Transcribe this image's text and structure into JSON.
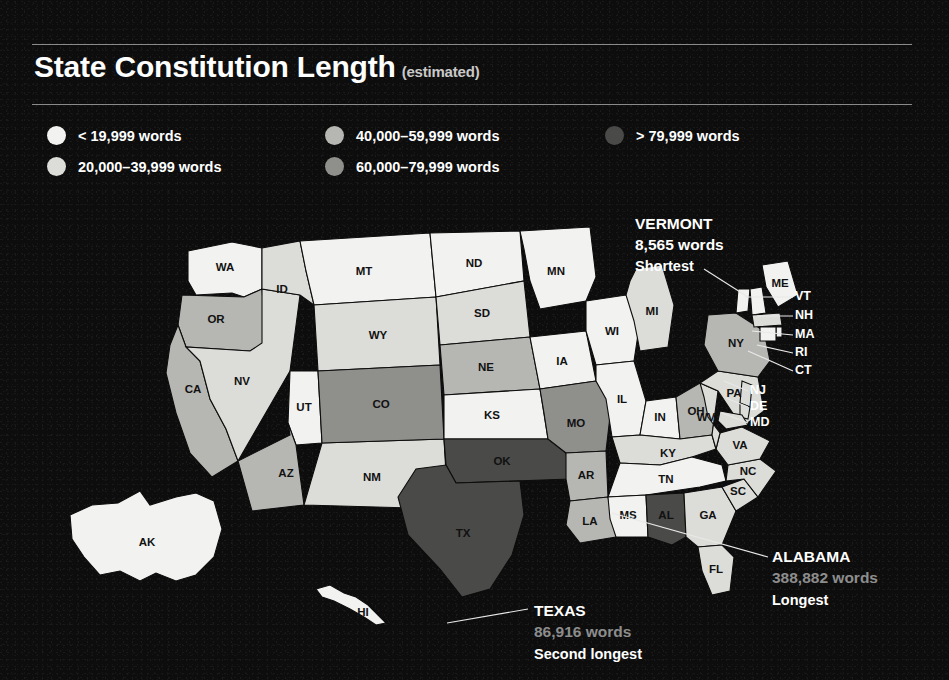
{
  "header": {
    "title": "State Constitution Length",
    "qualifier": "(estimated)"
  },
  "legend": {
    "items": [
      {
        "label": "< 19,999 words",
        "color": "#f2f2f0",
        "column": 1
      },
      {
        "label": "20,000–39,999 words",
        "color": "#dcdcd8",
        "column": 1
      },
      {
        "label": "40,000–59,999 words",
        "color": "#b6b6b2",
        "column": 2
      },
      {
        "label": "60,000–79,999 words",
        "color": "#8f8f8c",
        "column": 2
      },
      {
        "label": "> 79,999 words",
        "color": "#4a4a48",
        "column": 3
      }
    ]
  },
  "callouts": [
    {
      "id": "vermont",
      "name": "VERMONT",
      "words": "8,565 words",
      "rank": "Shortest"
    },
    {
      "id": "alabama",
      "name": "ALABAMA",
      "words": "388,882 words",
      "rank": "Longest"
    },
    {
      "id": "texas",
      "name": "TEXAS",
      "words": "86,916 words",
      "rank": "Second longest"
    }
  ],
  "map": {
    "title": "United States choropleth of state constitution word counts",
    "bin_colors": {
      "bin1": "#f2f2f0",
      "bin2": "#dcdcd8",
      "bin3": "#b6b6b2",
      "bin4": "#8f8f8c",
      "bin5": "#4a4a48"
    },
    "ne_callout_labels": [
      "ME",
      "VT",
      "NH",
      "MA",
      "RI",
      "CT",
      "NJ",
      "DE",
      "MD"
    ]
  },
  "chart_data": {
    "type": "map",
    "unit": "words",
    "bins": [
      {
        "name": "< 19,999 words",
        "min": 0,
        "max": 19999,
        "color": "#f2f2f0"
      },
      {
        "name": "20,000–39,999 words",
        "min": 20000,
        "max": 39999,
        "color": "#dcdcd8"
      },
      {
        "name": "40,000–59,999 words",
        "min": 40000,
        "max": 59999,
        "color": "#b6b6b2"
      },
      {
        "name": "60,000–79,999 words",
        "min": 60000,
        "max": 79999,
        "color": "#8f8f8c"
      },
      {
        "name": "> 79,999 words",
        "min": 80000,
        "max": null,
        "color": "#4a4a48"
      }
    ],
    "highlights": [
      {
        "state": "VT",
        "name": "VERMONT",
        "value": 8565,
        "note": "Shortest"
      },
      {
        "state": "AL",
        "name": "ALABAMA",
        "value": 388882,
        "note": "Longest"
      },
      {
        "state": "TX",
        "name": "TEXAS",
        "value": 86916,
        "note": "Second longest"
      }
    ],
    "states": [
      {
        "abbr": "AK",
        "bin": 1
      },
      {
        "abbr": "HI",
        "bin": 1
      },
      {
        "abbr": "WA",
        "bin": 1
      },
      {
        "abbr": "OR",
        "bin": 3
      },
      {
        "abbr": "CA",
        "bin": 3
      },
      {
        "abbr": "NV",
        "bin": 2
      },
      {
        "abbr": "ID",
        "bin": 2
      },
      {
        "abbr": "MT",
        "bin": 1
      },
      {
        "abbr": "WY",
        "bin": 2
      },
      {
        "abbr": "UT",
        "bin": 1
      },
      {
        "abbr": "AZ",
        "bin": 3
      },
      {
        "abbr": "NM",
        "bin": 2
      },
      {
        "abbr": "CO",
        "bin": 4
      },
      {
        "abbr": "ND",
        "bin": 1
      },
      {
        "abbr": "SD",
        "bin": 2
      },
      {
        "abbr": "NE",
        "bin": 3
      },
      {
        "abbr": "KS",
        "bin": 1
      },
      {
        "abbr": "OK",
        "bin": 5
      },
      {
        "abbr": "TX",
        "bin": 5
      },
      {
        "abbr": "MN",
        "bin": 1
      },
      {
        "abbr": "IA",
        "bin": 1
      },
      {
        "abbr": "MO",
        "bin": 4
      },
      {
        "abbr": "AR",
        "bin": 3
      },
      {
        "abbr": "LA",
        "bin": 3
      },
      {
        "abbr": "WI",
        "bin": 1
      },
      {
        "abbr": "IL",
        "bin": 1
      },
      {
        "abbr": "MI",
        "bin": 2
      },
      {
        "abbr": "IN",
        "bin": 1
      },
      {
        "abbr": "OH",
        "bin": 3
      },
      {
        "abbr": "KY",
        "bin": 2
      },
      {
        "abbr": "TN",
        "bin": 1
      },
      {
        "abbr": "MS",
        "bin": 1
      },
      {
        "abbr": "AL",
        "bin": 5
      },
      {
        "abbr": "GA",
        "bin": 2
      },
      {
        "abbr": "FL",
        "bin": 2
      },
      {
        "abbr": "SC",
        "bin": 2
      },
      {
        "abbr": "NC",
        "bin": 2
      },
      {
        "abbr": "VA",
        "bin": 2
      },
      {
        "abbr": "WV",
        "bin": 2
      },
      {
        "abbr": "PA",
        "bin": 2
      },
      {
        "abbr": "NY",
        "bin": 3
      },
      {
        "abbr": "VT",
        "bin": 1
      },
      {
        "abbr": "NH",
        "bin": 1
      },
      {
        "abbr": "ME",
        "bin": 1
      },
      {
        "abbr": "MA",
        "bin": 2
      },
      {
        "abbr": "RI",
        "bin": 1
      },
      {
        "abbr": "CT",
        "bin": 1
      },
      {
        "abbr": "NJ",
        "bin": 2
      },
      {
        "abbr": "DE",
        "bin": 2
      },
      {
        "abbr": "MD",
        "bin": 2
      }
    ]
  }
}
